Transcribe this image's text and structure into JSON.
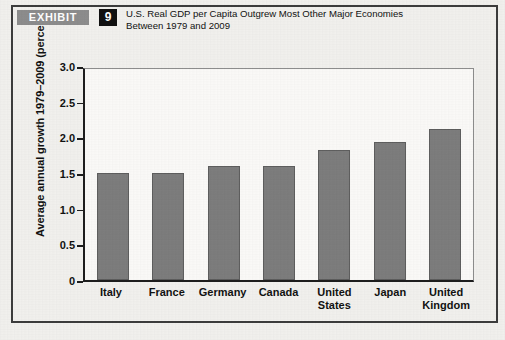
{
  "header": {
    "badge_label": "EXHIBIT",
    "number": "9",
    "title_line1": "U.S. Real GDP per Capita Outgrew Most Other Major Economies",
    "title_line2": "Between 1979 and 2009"
  },
  "colors": {
    "bar_fill": "#7d7d7d",
    "bar_edge": "#5e5e5e",
    "badge_bg": "#8d8d8d",
    "number_bg": "#101010",
    "axis": "#1d1d1d",
    "page_bg": "#f2f1ee"
  },
  "chart_data": {
    "type": "bar",
    "title": "U.S. Real GDP per Capita Outgrew Most Other Major Economies Between 1979 and 2009",
    "xlabel": "",
    "ylabel": "Average annual growth 1979–2009 (percent)",
    "categories": [
      "Italy",
      "France",
      "Germany",
      "Canada",
      "United States",
      "Japan",
      "United Kingdom"
    ],
    "values": [
      1.5,
      1.5,
      1.6,
      1.6,
      1.82,
      1.93,
      2.12
    ],
    "ylim": [
      0,
      3.0
    ],
    "yticks": [
      0,
      0.5,
      1.0,
      1.5,
      2.0,
      2.5,
      3.0
    ],
    "ytick_labels": [
      "0",
      "0.5",
      "1.0",
      "1.5",
      "2.0",
      "2.5",
      "3.0"
    ],
    "grid": false,
    "legend": null
  }
}
